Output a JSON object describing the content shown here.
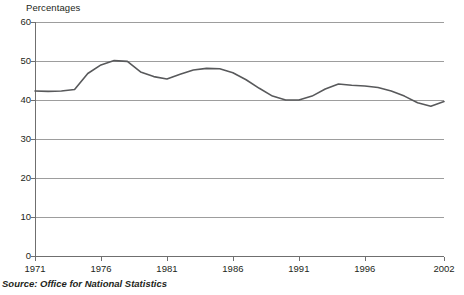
{
  "units_label": "Percentages",
  "source_note": "Source: Office for National Statistics",
  "chart_data": {
    "type": "line",
    "title": "",
    "subtitle": "",
    "xlabel": "",
    "ylabel": "Percentages",
    "xlim": [
      1971,
      2002
    ],
    "ylim": [
      0,
      60
    ],
    "ytick_labels": [
      "0",
      "10",
      "20",
      "30",
      "40",
      "50",
      "60"
    ],
    "ytick_values": [
      0,
      10,
      20,
      30,
      40,
      50,
      60
    ],
    "xtick_labels": [
      "1971",
      "1976",
      "1981",
      "1986",
      "1991",
      "1996",
      "2002"
    ],
    "xtick_values": [
      1971,
      1976,
      1981,
      1986,
      1991,
      1996,
      2002
    ],
    "grid": "horizontal",
    "legend": "none",
    "line_color": "#58595b",
    "line_width": 1.6,
    "x": [
      1971,
      1972,
      1973,
      1974,
      1975,
      1976,
      1977,
      1978,
      1979,
      1980,
      1981,
      1982,
      1983,
      1984,
      1985,
      1986,
      1987,
      1988,
      1989,
      1990,
      1991,
      1992,
      1993,
      1994,
      1995,
      1996,
      1997,
      1998,
      1999,
      2000,
      2001,
      2002
    ],
    "values": [
      42.3,
      42.2,
      42.3,
      42.7,
      46.8,
      49.0,
      50.1,
      49.9,
      47.2,
      46.0,
      45.4,
      46.6,
      47.7,
      48.1,
      48.0,
      47.0,
      45.2,
      43.0,
      41.0,
      40.0,
      40.0,
      41.0,
      42.8,
      44.1,
      43.8,
      43.6,
      43.2,
      42.3,
      41.0,
      39.3,
      38.4,
      39.6
    ],
    "annotations": []
  }
}
